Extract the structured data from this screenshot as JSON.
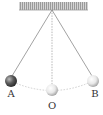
{
  "diagram": {
    "type": "pendulum",
    "ceiling": {
      "x": 19,
      "y": 2,
      "width": 69,
      "height": 8,
      "color": "#9a9a9a"
    },
    "pivot": {
      "x": 52,
      "y": 10
    },
    "balls": [
      {
        "id": "A",
        "label": "A",
        "cx": 11,
        "cy": 81,
        "r": 6,
        "color": "#555555"
      },
      {
        "id": "O",
        "label": "O",
        "cx": 52,
        "cy": 90,
        "r": 6,
        "color": "#e6e6e6"
      },
      {
        "id": "B",
        "label": "B",
        "cx": 93,
        "cy": 81,
        "r": 6,
        "color": "#e6e6e6"
      }
    ],
    "labels": {
      "a": "A",
      "o": "O",
      "b": "B"
    },
    "string_color": "#7a7a7a",
    "arc_color": "#cccccc"
  }
}
